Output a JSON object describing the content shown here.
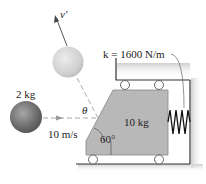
{
  "diagram": {
    "type": "physics-collision",
    "ball_mass_label": "2 kg",
    "initial_speed_label": "10 m/s",
    "rebound_velocity_label": "v′",
    "angle_label": "θ",
    "block_mass_label": "10 kg",
    "incline_angle_label": "60°",
    "spring_constant_label": "k = 1600 N/m"
  },
  "colors": {
    "block_fill": "#b8b8b8",
    "ball_dark": "#6a6a6a",
    "ball_light": "#d2d2d2",
    "dashed_line": "#aaaaaa",
    "wall_shadow": "#d9d9d9",
    "text": "#222222"
  }
}
